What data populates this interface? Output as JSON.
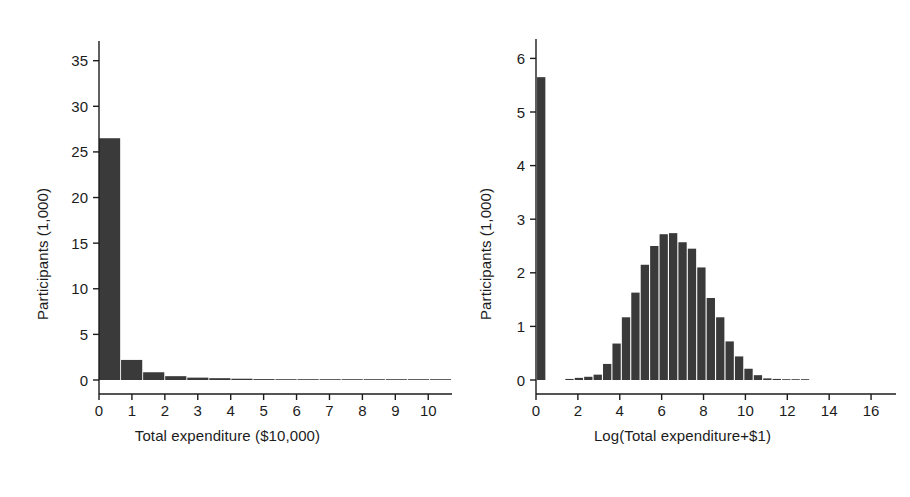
{
  "figure": {
    "background_color": "#ffffff",
    "bar_color": "#3a3a3a",
    "axis_color": "#1c1c1c"
  },
  "panels": [
    {
      "name": "total-expenditure-histogram",
      "ylabel": "Participants (1,000)",
      "xlabel": "Total expenditure ($10,000)"
    },
    {
      "name": "log-total-expenditure-histogram",
      "ylabel": "Participants (1,000)",
      "xlabel": "Log(Total expenditure+$1)"
    }
  ],
  "chart_data": [
    {
      "type": "bar",
      "title": "",
      "xlabel": "Total expenditure ($10,000)",
      "ylabel": "Participants (1,000)",
      "xlim": [
        0,
        10.6
      ],
      "ylim": [
        0,
        36.5
      ],
      "xticks": [
        0,
        1,
        2,
        3,
        4,
        5,
        6,
        7,
        8,
        9,
        10
      ],
      "xtick_labels": [
        "0",
        "1",
        "2",
        "3",
        "4",
        "5",
        "6",
        "7",
        "8",
        "9",
        "10"
      ],
      "yticks": [
        0,
        5,
        10,
        15,
        20,
        25,
        30,
        35
      ],
      "ytick_labels": [
        "0",
        "5",
        "10",
        "15",
        "20",
        "25",
        "30",
        "35"
      ],
      "grid": false,
      "legend": "none",
      "bin_width": 0.67,
      "bin_starts": [
        0.0,
        0.67,
        1.34,
        2.01,
        2.68,
        3.35,
        4.02,
        4.69,
        5.36,
        6.03,
        6.7,
        7.37,
        8.04,
        8.71,
        9.38,
        10.05
      ],
      "values": [
        26.5,
        2.2,
        0.85,
        0.42,
        0.26,
        0.2,
        0.14,
        0.1,
        0.08,
        0.06,
        0.05,
        0.04,
        0.03,
        0.03,
        0.02,
        0.02
      ]
    },
    {
      "type": "bar",
      "title": "",
      "xlabel": "Log(Total expenditure+$1)",
      "ylabel": "Participants (1,000)",
      "xlim": [
        0,
        17.0
      ],
      "ylim": [
        0,
        6.25
      ],
      "xticks": [
        0,
        2,
        4,
        6,
        8,
        10,
        12,
        14,
        16
      ],
      "xtick_labels": [
        "0",
        "2",
        "4",
        "6",
        "8",
        "10",
        "12",
        "14",
        "16"
      ],
      "yticks": [
        0,
        1,
        2,
        3,
        4,
        5,
        6
      ],
      "ytick_labels": [
        "0",
        "1",
        "2",
        "3",
        "4",
        "5",
        "6"
      ],
      "grid": false,
      "legend": "none",
      "bin_width": 0.44,
      "bin_starts": [
        0.05,
        1.4,
        1.85,
        2.3,
        2.75,
        3.2,
        3.65,
        4.1,
        4.55,
        5.0,
        5.45,
        5.9,
        6.35,
        6.8,
        7.25,
        7.7,
        8.15,
        8.6,
        9.05,
        9.5,
        9.95,
        10.4,
        10.85,
        11.3,
        11.75,
        12.2,
        12.65
      ],
      "values": [
        5.65,
        0.02,
        0.04,
        0.06,
        0.1,
        0.3,
        0.68,
        1.17,
        1.63,
        2.15,
        2.5,
        2.72,
        2.74,
        2.57,
        2.45,
        2.1,
        1.53,
        1.17,
        0.72,
        0.44,
        0.21,
        0.09,
        0.03,
        0.02,
        0.01,
        0.01,
        0.01
      ]
    }
  ]
}
